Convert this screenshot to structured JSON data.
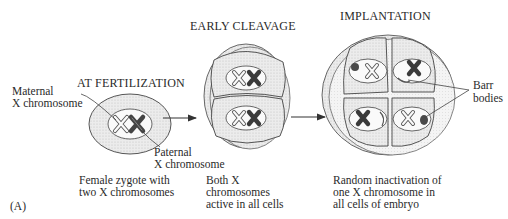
{
  "figure": {
    "panel_label": "(A)",
    "stages": [
      {
        "title": "AT FERTILIZATION",
        "caption": [
          "Female zygote with",
          "two X chromosomes"
        ]
      },
      {
        "title": "EARLY CLEAVAGE",
        "caption": [
          "Both X",
          "chromosomes",
          "active in all cells"
        ]
      },
      {
        "title": "IMPLANTATION",
        "caption": [
          "Random inactivation of",
          "one X chromosome in",
          "all cells of embryo"
        ]
      }
    ],
    "labels": {
      "maternal": [
        "Maternal",
        "X chromosome"
      ],
      "paternal": [
        "Paternal",
        "X chromosome"
      ],
      "barr": [
        "Barr",
        "bodies"
      ]
    },
    "colors": {
      "line": "#3a3a3a",
      "cell_fill": "#e6e6e6",
      "nucleus_fill": "#f7f7f7",
      "active_x_dark": "#3c3c3c",
      "barr_body": "#555555"
    }
  }
}
